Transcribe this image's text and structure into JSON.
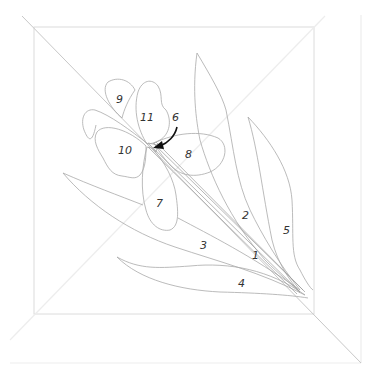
{
  "diagram": {
    "type": "applique-pattern-template",
    "colors": {
      "background": "#ffffff",
      "outline": "#a9a9a9",
      "frame": "#dcdcdc",
      "label": "#333333",
      "arrow": "#111111"
    },
    "labels": [
      {
        "id": "1",
        "text": "1",
        "x": 255,
        "y": 259
      },
      {
        "id": "2",
        "text": "2",
        "x": 244,
        "y": 219
      },
      {
        "id": "3",
        "text": "3",
        "x": 202,
        "y": 249
      },
      {
        "id": "4",
        "text": "4",
        "x": 240,
        "y": 287
      },
      {
        "id": "5",
        "text": "5",
        "x": 285,
        "y": 234
      },
      {
        "id": "6",
        "text": "6",
        "x": 174,
        "y": 121
      },
      {
        "id": "7",
        "text": "7",
        "x": 158,
        "y": 207
      },
      {
        "id": "8",
        "text": "8",
        "x": 187,
        "y": 158
      },
      {
        "id": "9",
        "text": "9",
        "x": 118,
        "y": 103
      },
      {
        "id": "10",
        "text": "10",
        "x": 121,
        "y": 154
      },
      {
        "id": "11",
        "text": "11",
        "x": 143,
        "y": 121
      }
    ]
  }
}
